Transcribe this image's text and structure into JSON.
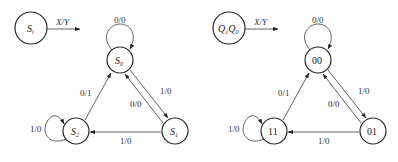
{
  "diagrams": [
    {
      "name": "symbolic-state-diagram",
      "legend": {
        "node_main": "S",
        "node_sub": "i",
        "edge_label": "X/Y"
      },
      "states": [
        {
          "id": "S0",
          "main": "S",
          "sub": "0"
        },
        {
          "id": "S1",
          "main": "S",
          "sub": "1"
        },
        {
          "id": "S2",
          "main": "S",
          "sub": "2"
        }
      ],
      "transitions": [
        {
          "from": "S0",
          "to": "S0",
          "label": "0/0"
        },
        {
          "from": "S0",
          "to": "S1",
          "label": "1/0"
        },
        {
          "from": "S1",
          "to": "S0",
          "label": "0/0"
        },
        {
          "from": "S1",
          "to": "S2",
          "label": "1/0"
        },
        {
          "from": "S2",
          "to": "S0",
          "label": "0/1"
        },
        {
          "from": "S2",
          "to": "S2",
          "label": "1/0"
        }
      ]
    },
    {
      "name": "encoded-state-diagram",
      "legend": {
        "node_q1": "Q",
        "node_q1_sub": "1",
        "node_q0": "Q",
        "node_q0_sub": "0",
        "edge_label": "X/Y"
      },
      "states": [
        {
          "id": "00",
          "label": "00"
        },
        {
          "id": "01",
          "label": "01"
        },
        {
          "id": "11",
          "label": "11"
        }
      ],
      "transitions": [
        {
          "from": "00",
          "to": "00",
          "label": "0/0"
        },
        {
          "from": "00",
          "to": "01",
          "label": "1/0"
        },
        {
          "from": "01",
          "to": "00",
          "label": "0/0"
        },
        {
          "from": "01",
          "to": "11",
          "label": "1/0"
        },
        {
          "from": "11",
          "to": "00",
          "label": "0/1"
        },
        {
          "from": "11",
          "to": "11",
          "label": "1/0"
        }
      ]
    }
  ]
}
